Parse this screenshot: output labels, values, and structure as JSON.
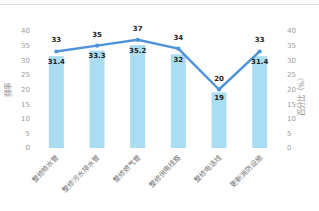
{
  "page": {
    "background_color": "#ffffff",
    "top_divider_color": "#dddddb"
  },
  "chart_data": {
    "type": "bar+line",
    "categories": [
      "整修给水管",
      "整修污水排水管",
      "整修燃气管",
      "整修供电线路",
      "整修电话线",
      "更新消防设施"
    ],
    "series": [
      {
        "name": "百分比",
        "type": "bar",
        "axis": "right",
        "values": [
          31.4,
          33.3,
          35.2,
          32,
          19,
          31.4
        ],
        "labels": [
          "31.4",
          "33.3",
          "35.2",
          "32",
          "19",
          "31.4"
        ],
        "color": "#aadcf2"
      },
      {
        "name": "频率",
        "type": "line",
        "axis": "left",
        "values": [
          33,
          35,
          37,
          34,
          20,
          33
        ],
        "labels": [
          "33",
          "35",
          "37",
          "34",
          "20",
          "33"
        ],
        "color": "#4e93d8"
      }
    ],
    "y_axis_left": {
      "title": "频率",
      "min": 0,
      "max": 40,
      "step": 5,
      "ticks": [
        "0",
        "5",
        "10",
        "15",
        "20",
        "25",
        "30",
        "35",
        "40"
      ]
    },
    "y_axis_right": {
      "title": "百分比（%）",
      "min": 0,
      "max": 40,
      "step": 5,
      "ticks": [
        "0",
        "5",
        "10",
        "15",
        "20",
        "25",
        "30",
        "35",
        "40"
      ]
    },
    "grid": false,
    "legend": "none",
    "axes_lines": "none",
    "data_label_color": "#1f1f1f",
    "tick_label_color": "#9b9b9b",
    "axis_title_color": "#8d8d8d",
    "category_label_color": "#717171"
  }
}
